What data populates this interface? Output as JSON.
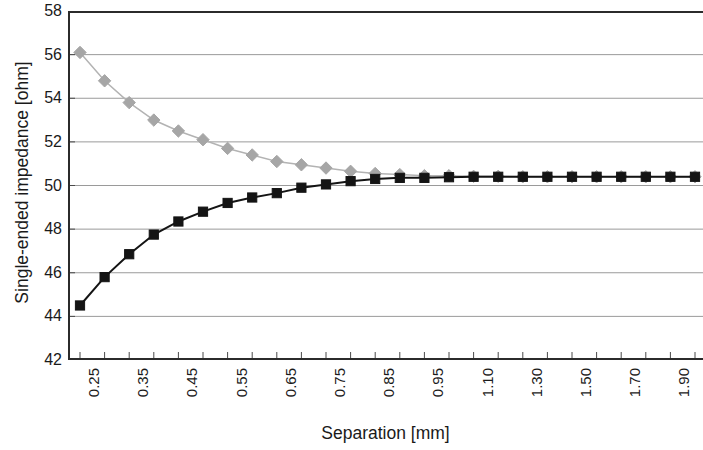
{
  "chart_data": {
    "type": "line",
    "title": "",
    "xlabel": "Separation [mm]",
    "ylabel": "Single-ended impedance [ohm]",
    "ylim": [
      42,
      58
    ],
    "yticks": [
      42,
      44,
      46,
      48,
      50,
      52,
      54,
      56,
      58
    ],
    "grid": true,
    "legend": "none",
    "x": [
      0.25,
      0.3,
      0.35,
      0.4,
      0.45,
      0.5,
      0.55,
      0.6,
      0.65,
      0.7,
      0.75,
      0.8,
      0.85,
      0.9,
      0.95,
      1.0,
      1.1,
      1.2,
      1.3,
      1.4,
      1.5,
      1.6,
      1.7,
      1.8,
      1.9,
      2.0
    ],
    "xtick_labels": [
      "0.25",
      "",
      "0.35",
      "",
      "0.45",
      "",
      "0.55",
      "",
      "0.65",
      "",
      "0.75",
      "",
      "0.85",
      "",
      "0.95",
      "",
      "1.10",
      "",
      "1.30",
      "",
      "1.50",
      "",
      "1.70",
      "",
      "1.90",
      ""
    ],
    "xtick_labels_visible": [
      "0.25",
      "0.35",
      "0.45",
      "0.55",
      "0.65",
      "0.75",
      "0.85",
      "0.95",
      "1.10",
      "1.30",
      "1.50",
      "1.70",
      "1.90"
    ],
    "series": [
      {
        "name": "upper",
        "marker": "diamond",
        "color": "#a6a6a6",
        "line_color": "#b3b3b3",
        "values": [
          56.1,
          54.8,
          53.8,
          53.0,
          52.5,
          52.1,
          51.7,
          51.4,
          51.1,
          50.95,
          50.8,
          50.65,
          50.55,
          50.5,
          50.45,
          50.45,
          50.42,
          50.42,
          50.4,
          50.4,
          50.4,
          50.4,
          50.4,
          50.4,
          50.4,
          50.4
        ]
      },
      {
        "name": "lower",
        "marker": "square",
        "color": "#141414",
        "line_color": "#141414",
        "values": [
          44.5,
          45.8,
          46.85,
          47.75,
          48.35,
          48.8,
          49.2,
          49.45,
          49.65,
          49.9,
          50.05,
          50.2,
          50.3,
          50.35,
          50.35,
          50.38,
          50.4,
          50.4,
          50.4,
          50.4,
          50.4,
          50.4,
          50.4,
          50.4,
          50.4,
          50.4
        ]
      }
    ]
  }
}
